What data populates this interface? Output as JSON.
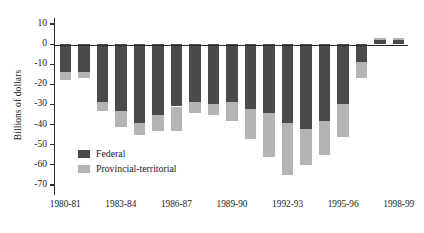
{
  "chart_data": {
    "type": "bar",
    "stacked": true,
    "title": "",
    "subtitle": "",
    "xlabel": "",
    "ylabel": "Billions of dollars",
    "ylim": [
      -75,
      13
    ],
    "yticks": [
      10,
      0,
      -10,
      -20,
      -30,
      -40,
      -50,
      -60,
      -70
    ],
    "ytick_labels": [
      "10",
      "0",
      "-10",
      "-20",
      "-30",
      "-40",
      "-50",
      "-60",
      "-70"
    ],
    "grid": false,
    "legend_position": "inside-lower-left",
    "categories": [
      "1980-81",
      "1981-82",
      "1982-83",
      "1983-84",
      "1984-85",
      "1985-86",
      "1986-87",
      "1987-88",
      "1988-89",
      "1989-90",
      "1990-91",
      "1991-92",
      "1992-93",
      "1993-94",
      "1994-95",
      "1995-96",
      "1996-97",
      "1997-98",
      "1998-99"
    ],
    "xtick_labels_shown": [
      "1980-81",
      "1983-84",
      "1986-87",
      "1989-90",
      "1992-93",
      "1995-96",
      "1998-99"
    ],
    "xtick_label_indices": [
      0,
      3,
      6,
      9,
      12,
      15,
      18
    ],
    "series": [
      {
        "name": "Federal",
        "color": "#4a4a4a",
        "values": [
          -14,
          -14,
          -29,
          -33,
          -39,
          -35,
          -31,
          -29,
          -30,
          -29,
          -32,
          -34,
          -39,
          -42,
          -38,
          -30,
          -9,
          3,
          3
        ]
      },
      {
        "name": "Provincial-territorial",
        "color": "#b4b4b4",
        "values": [
          -4,
          -3,
          -4,
          -8,
          -6,
          -8,
          -12,
          -5,
          -5,
          -9,
          -15,
          -22,
          -26,
          -18,
          -17,
          -16,
          -8,
          -1,
          -1
        ]
      }
    ],
    "totals": [
      -18,
      -17,
      -33,
      -41,
      -45,
      -43,
      -43,
      -34,
      -35,
      -38,
      -47,
      -56,
      -65,
      -60,
      -55,
      -46,
      -17,
      2,
      2
    ]
  },
  "legend": {
    "items": [
      {
        "label": "Federal",
        "color": "#4a4a4a"
      },
      {
        "label": "Provincial-territorial",
        "color": "#b4b4b4"
      }
    ]
  },
  "axis": {
    "y_title": "Billions of dollars"
  }
}
